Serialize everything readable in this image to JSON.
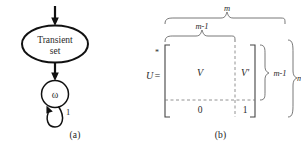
{
  "figure": {
    "background_color": "#ffffff",
    "stroke_color": "#1a1a1a",
    "panels": [
      {
        "id": "a",
        "caption": "(a)"
      },
      {
        "id": "b",
        "caption": "(b)"
      }
    ]
  },
  "panel_a": {
    "caption": "(a)",
    "nodes": [
      {
        "id": "transient",
        "shape": "ellipse",
        "label_line1": "Transient",
        "label_line2": "set"
      },
      {
        "id": "omega",
        "shape": "circle",
        "label": "ω"
      }
    ],
    "edges": [
      {
        "id": "entry-arrow",
        "from": "",
        "to": "transient",
        "label": ""
      },
      {
        "id": "transient-to-omega",
        "from": "transient",
        "to": "omega",
        "label": ""
      },
      {
        "id": "omega-self-loop",
        "from": "omega",
        "to": "omega",
        "label": "1"
      }
    ]
  },
  "panel_b": {
    "caption": "(b)",
    "equation_lhs": "U",
    "equation_equals": "=",
    "superscript": "*",
    "top_brace_outer_label": "m",
    "top_brace_inner_label": "m-1",
    "right_brace_inner_label": "m-1",
    "right_brace_outer_label": "m",
    "blocks": {
      "top_left": "V",
      "top_right": "V'",
      "bottom_left": "0",
      "bottom_right": "1"
    }
  }
}
